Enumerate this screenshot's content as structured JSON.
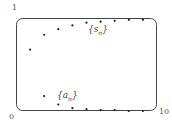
{
  "chart_data": {
    "type": "scatter",
    "title": "",
    "xlabel": "",
    "ylabel": "",
    "xlim": [
      0,
      10
    ],
    "ylim": [
      0,
      1
    ],
    "x_tick_labels": [
      "0",
      "10"
    ],
    "y_tick_labels": [
      "1"
    ],
    "grid": false,
    "legend": "inline annotations",
    "series": [
      {
        "name": "{s_n}",
        "x": [
          1,
          2,
          3,
          4,
          5,
          6,
          7,
          8,
          9
        ],
        "values": [
          0.66,
          0.82,
          0.88,
          0.92,
          0.95,
          0.96,
          0.97,
          0.98,
          0.98
        ]
      },
      {
        "name": "{a_n}",
        "x": [
          2,
          3,
          4,
          5,
          6,
          7,
          8,
          9
        ],
        "values": [
          0.16,
          0.07,
          0.03,
          0.02,
          0.01,
          0.01,
          0.0,
          0.0
        ]
      }
    ]
  },
  "labels": {
    "x_min": "0",
    "x_max": "10",
    "y_max": "1",
    "s_series": "{s",
    "s_sub": "n",
    "a_series": "{a",
    "a_sub": "n",
    "close_brace": "}"
  }
}
